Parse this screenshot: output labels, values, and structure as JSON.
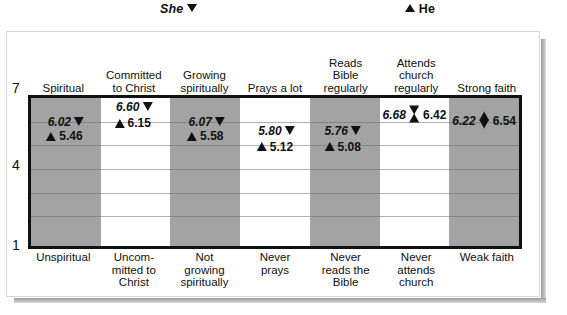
{
  "legend": {
    "she": {
      "label": "She",
      "marker": "triangle-down-icon"
    },
    "he": {
      "label": "He",
      "marker": "triangle-up-icon"
    }
  },
  "axis": {
    "ticks": [
      "7",
      "4",
      "1"
    ],
    "min": 1,
    "max": 7
  },
  "chart_data": {
    "type": "scatter",
    "title": "",
    "xlabel": "",
    "ylabel": "",
    "ylim": [
      1,
      7
    ],
    "grid": true,
    "legend_position": "top",
    "categories": [
      "Spiritual",
      "Committed to Christ",
      "Growing spiritually",
      "Prays a lot",
      "Reads Bible regularly",
      "Attends church regularly",
      "Strong faith"
    ],
    "category_top_lines": [
      [
        "Spiritual"
      ],
      [
        "Committed",
        "to Christ"
      ],
      [
        "Growing",
        "spiritually"
      ],
      [
        "Prays a lot"
      ],
      [
        "Reads",
        "Bible",
        "regularly"
      ],
      [
        "Attends",
        "church",
        "regularly"
      ],
      [
        "Strong faith"
      ]
    ],
    "category_bottom_lines": [
      [
        "Unspiritual"
      ],
      [
        "Uncom-",
        "mitted to",
        "Christ"
      ],
      [
        "Not",
        "growing",
        "spiritually"
      ],
      [
        "Never",
        "prays"
      ],
      [
        "Never",
        "reads the",
        "Bible"
      ],
      [
        "Never",
        "attends",
        "church"
      ],
      [
        "Weak faith"
      ]
    ],
    "series": [
      {
        "name": "She",
        "values": [
          6.02,
          6.6,
          6.07,
          5.8,
          5.76,
          6.68,
          6.22
        ]
      },
      {
        "name": "He",
        "values": [
          5.46,
          6.15,
          5.58,
          5.12,
          5.08,
          6.42,
          6.54
        ]
      }
    ]
  },
  "points": [
    {
      "category": "Spiritual",
      "band": "shaded",
      "she": {
        "value": "6.02",
        "label_side": "left",
        "top_pct": 16,
        "left_pct": 50
      },
      "he": {
        "value": "5.46",
        "label_side": "right",
        "top_pct": 26,
        "left_pct": 48
      },
      "combined": null
    },
    {
      "category": "Committed to Christ",
      "band": "plain",
      "she": {
        "value": "6.60",
        "label_side": "left",
        "top_pct": 6,
        "left_pct": 48
      },
      "he": {
        "value": "6.15",
        "label_side": "right",
        "top_pct": 17,
        "left_pct": 46
      },
      "combined": null
    },
    {
      "category": "Growing spiritually",
      "band": "shaded",
      "she": {
        "value": "6.07",
        "label_side": "left",
        "top_pct": 16,
        "left_pct": 52
      },
      "he": {
        "value": "5.58",
        "label_side": "right",
        "top_pct": 26,
        "left_pct": 50
      },
      "combined": null
    },
    {
      "category": "Prays a lot",
      "band": "plain",
      "she": {
        "value": "5.80",
        "label_side": "left",
        "top_pct": 22,
        "left_pct": 52
      },
      "he": {
        "value": "5.12",
        "label_side": "right",
        "top_pct": 33,
        "left_pct": 50
      },
      "combined": null
    },
    {
      "category": "Reads Bible regularly",
      "band": "shaded",
      "she": {
        "value": "5.76",
        "label_side": "left",
        "top_pct": 22,
        "left_pct": 47
      },
      "he": {
        "value": "5.08",
        "label_side": "right",
        "top_pct": 33,
        "left_pct": 47
      },
      "combined": null
    },
    {
      "category": "Attends church regularly",
      "band": "plain",
      "she": null,
      "he": null,
      "combined": {
        "glyph": "hourglass-marker-icon",
        "she_value": "6.68",
        "he_value": "6.42",
        "top_pct": 11,
        "left_pct": 50
      }
    },
    {
      "category": "Strong faith",
      "band": "shaded",
      "she": null,
      "he": null,
      "combined": {
        "glyph": "diamond-marker-icon",
        "she_value": "6.22",
        "he_value": "6.54",
        "top_pct": 15,
        "left_pct": 50
      }
    }
  ],
  "style": {
    "band_shaded_color": "#a3a3a3",
    "band_plain_color": "#ffffff",
    "plot_border_color": "#111111",
    "gridline_color": "#6f6f6f",
    "text_color": "#111111"
  },
  "gridline_positions_pct": [
    16,
    32,
    48,
    64,
    80
  ]
}
